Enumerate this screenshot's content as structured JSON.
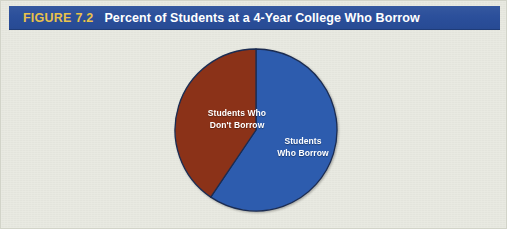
{
  "figure": {
    "label": "FIGURE",
    "number": "7.2",
    "title": "Percent of Students at a 4-Year College Who Borrow"
  },
  "colors": {
    "header_blue": "#2b4f9b",
    "figure_label_gold": "#e9c24b",
    "title_white": "#ffffff",
    "slice_borrow_blue": "#2d5cae",
    "slice_dont_borrow_brown": "#8b3218",
    "background_cream": "#e9eae2",
    "outline": "#1b2c52"
  },
  "chart_data": {
    "type": "pie",
    "title": "Percent of Students at a 4-Year College Who Borrow",
    "labels": [
      "Students Who Borrow",
      "Students Who Don't Borrow"
    ],
    "values": [
      59,
      41
    ],
    "unit": "percent",
    "start_angle_deg": 0,
    "direction": "clockwise",
    "legend": "none",
    "labels_position": "inside-slices",
    "slices": [
      {
        "name": "Students Who Borrow",
        "label_line1": "Students",
        "label_line2": "Who Borrow",
        "value": 59,
        "sweep_deg": 214,
        "color": "#2d5cae",
        "label_color": "#ffffff"
      },
      {
        "name": "Students Who Don't Borrow",
        "label_line1": "Students Who",
        "label_line2": "Don't Borrow",
        "value": 41,
        "sweep_deg": 146,
        "color": "#8b3218",
        "label_color": "#ffffff"
      }
    ]
  }
}
